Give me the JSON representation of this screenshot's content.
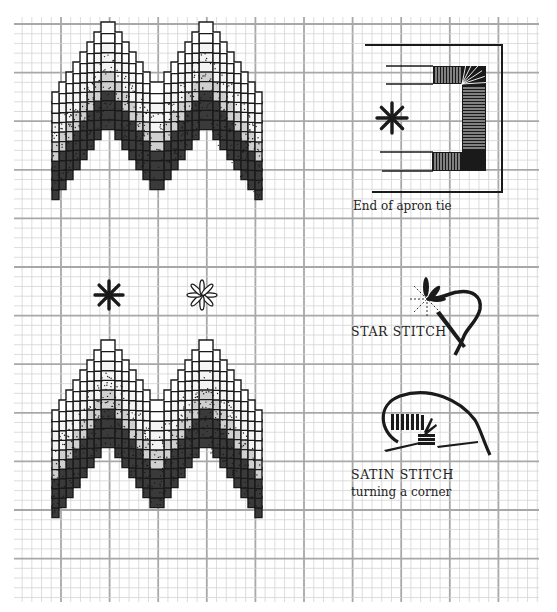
{
  "colors": {
    "paper": "#ffffff",
    "grid_minor": "#d4d4d4",
    "grid_major": "#a8a8a8",
    "ink": "#1a1a1a",
    "fill_light": "#f4f4f4",
    "fill_medium": "#cfcfcf",
    "fill_dark": "#3a3a3a"
  },
  "grid": {
    "left": 14,
    "top": 17,
    "right": 539,
    "bottom": 602,
    "minor_step": 9.72,
    "major_every": 5,
    "major_origin_x": 61,
    "major_origin_y": 24
  },
  "bargello_panels": [
    {
      "name": "upper-bargello-pattern",
      "x": 52,
      "top": 22,
      "width": 208,
      "height": 232
    },
    {
      "name": "lower-bargello-pattern",
      "x": 52,
      "top": 340,
      "width": 208,
      "height": 234
    }
  ],
  "stars": [
    {
      "name": "solid-star-stitch-icon",
      "cx": 109,
      "cy": 295,
      "r": 14,
      "style": "solid"
    },
    {
      "name": "outlined-star-stitch-icon",
      "cx": 202,
      "cy": 295,
      "r": 15,
      "style": "outline"
    },
    {
      "name": "apron-star-stitch-icon",
      "cx": 392,
      "cy": 118,
      "r": 15,
      "style": "solid"
    }
  ],
  "annotations": {
    "apron_tie": {
      "caption": "End of apron tie"
    },
    "star_stitch": {
      "caption": "STAR STITCH"
    },
    "satin_stitch": {
      "caption": "SATIN STITCH",
      "subcaption": "turning a corner"
    }
  }
}
